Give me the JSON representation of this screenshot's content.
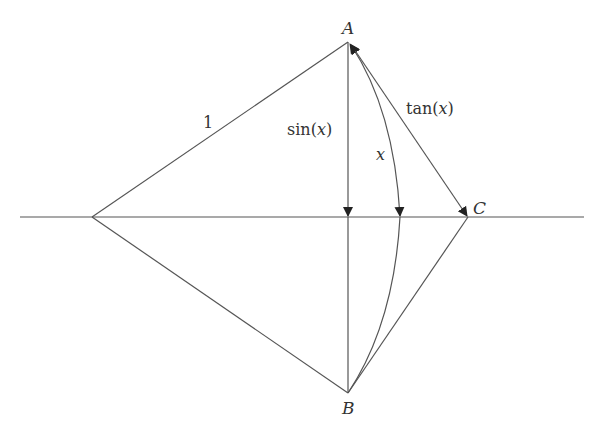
{
  "diagram": {
    "labels": {
      "A": "A",
      "B": "B",
      "C": "C",
      "radius": "1",
      "sin": "sin(",
      "tan": "tan(",
      "x": "x",
      "close_paren": ")"
    },
    "points": {
      "O": [
        92,
        217
      ],
      "A": [
        348,
        42
      ],
      "B": [
        348,
        393
      ],
      "C": [
        468,
        217
      ],
      "D": [
        348,
        217
      ],
      "arc_mid": [
        400,
        217
      ]
    },
    "colors": {
      "stroke": "#555555",
      "text": "#333333",
      "background": "#ffffff"
    }
  }
}
